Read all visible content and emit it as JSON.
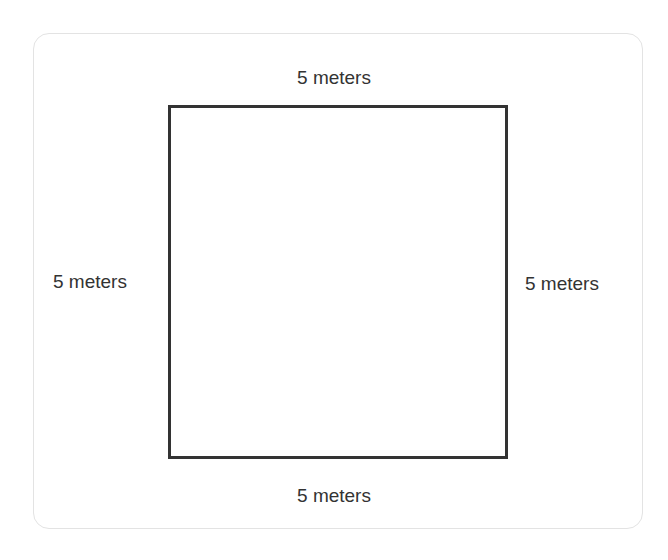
{
  "diagram": {
    "shape": "square",
    "sides": {
      "top": "5 meters",
      "bottom": "5 meters",
      "left": "5 meters",
      "right": "5 meters"
    },
    "colors": {
      "stroke": "#333333",
      "text": "#333333",
      "card_border": "#e3e3e3"
    }
  }
}
